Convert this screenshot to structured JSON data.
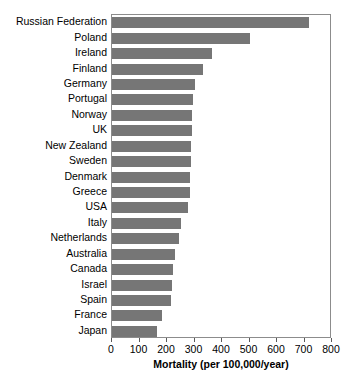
{
  "chart_data": {
    "type": "bar",
    "orientation": "horizontal",
    "title": "",
    "xlabel": "Mortality (per 100,000/year)",
    "ylabel": "",
    "xlim": [
      0,
      800
    ],
    "xticks": [
      0,
      100,
      200,
      300,
      400,
      500,
      600,
      700,
      800
    ],
    "xtick_labels": [
      "0",
      "100",
      "200",
      "300",
      "400",
      "500",
      "600",
      "700",
      "800"
    ],
    "grid": false,
    "legend": null,
    "bar_color": "#767676",
    "frame_color": "#8c8c8c",
    "categories": [
      "Russian Federation",
      "Poland",
      "Ireland",
      "Finland",
      "Germany",
      "Portugal",
      "Norway",
      "UK",
      "New Zealand",
      "Sweden",
      "Denmark",
      "Greece",
      "USA",
      "Italy",
      "Netherlands",
      "Australia",
      "Canada",
      "Israel",
      "Spain",
      "France",
      "Japan"
    ],
    "values": [
      716,
      500,
      362,
      330,
      300,
      296,
      292,
      290,
      288,
      286,
      285,
      283,
      278,
      252,
      244,
      228,
      222,
      218,
      215,
      180,
      164
    ]
  }
}
